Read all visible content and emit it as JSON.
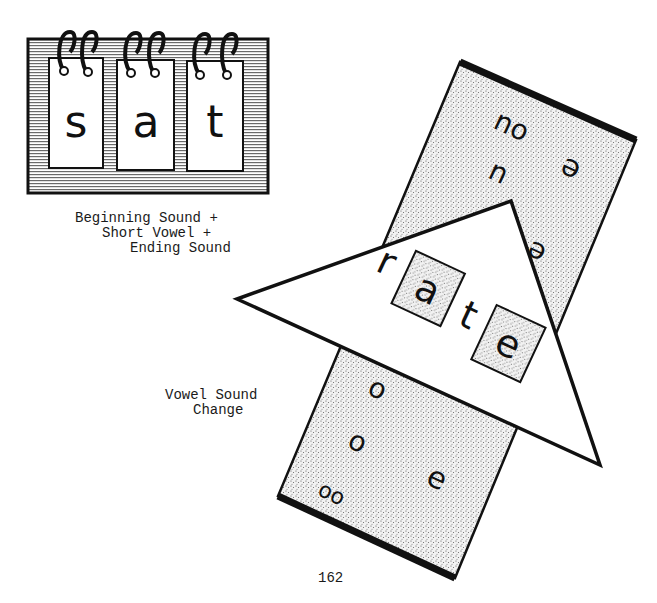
{
  "flip_chart": {
    "letters": [
      "s",
      "a",
      "t"
    ],
    "caption": [
      "Beginning Sound +",
      "Short Vowel +",
      "Ending Sound"
    ]
  },
  "vowel_wheel": {
    "triangle_letters": [
      "r",
      "a",
      "t",
      "e"
    ],
    "strip_top_letters": [
      "ou",
      "u",
      "i",
      "e",
      "e"
    ],
    "strip_bottom_letters": [
      "o",
      "o",
      "oo",
      "e"
    ],
    "caption": [
      "Vowel Sound",
      "Change"
    ]
  },
  "page_number": "162",
  "colors": {
    "ink": "#111111",
    "paper": "#ffffff",
    "stipple": "#d9d9d9"
  }
}
